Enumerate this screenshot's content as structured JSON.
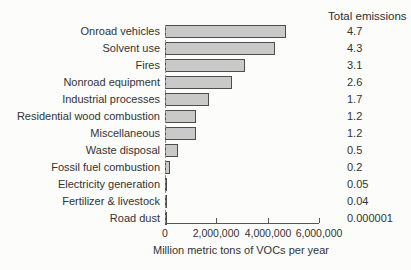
{
  "chart_data": {
    "type": "bar",
    "orientation": "horizontal",
    "right_column_header": "Total emissions",
    "categories": [
      "Onroad vehicles",
      "Solvent use",
      "Fires",
      "Nonroad equipment",
      "Industrial processes",
      "Residential wood combustion",
      "Miscellaneous",
      "Waste disposal",
      "Fossil fuel combustion",
      "Electricity generation",
      "Fertilizer & livestock",
      "Road dust"
    ],
    "values": [
      4700000,
      4300000,
      3100000,
      2600000,
      1700000,
      1200000,
      1200000,
      500000,
      200000,
      50000,
      40000,
      1
    ],
    "totals": [
      "4.7",
      "4.3",
      "3.1",
      "2.6",
      "1.7",
      "1.2",
      "1.2",
      "0.5",
      "0.2",
      "0.05",
      "0.04",
      "0.000001"
    ],
    "xlabel": "Million metric tons of VOCs per year",
    "xlim": [
      0,
      6000000
    ],
    "xticks": [
      {
        "value": 0,
        "label": "0"
      },
      {
        "value": 2000000,
        "label": "2,000,000"
      },
      {
        "value": 4000000,
        "label": "4,000,000"
      },
      {
        "value": 6000000,
        "label": "6,000,000"
      }
    ],
    "grid": false,
    "legend": false,
    "bar_fill_color": "#c9c9c9",
    "bar_border_color": "#4d4d4d"
  }
}
